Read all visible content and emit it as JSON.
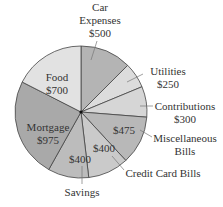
{
  "chart_data": {
    "type": "pie",
    "title": "",
    "unit": "$",
    "total": 4000,
    "start": "12 o'clock",
    "direction": "clockwise",
    "slices": [
      {
        "name": "Car Expenses",
        "value": 500,
        "label_lines": [
          "Car",
          "Expenses",
          "$500"
        ],
        "color": "#b4b4b4",
        "label_inside": false
      },
      {
        "name": "Utilities",
        "value": 250,
        "label_lines": [
          "Utilities",
          "$250"
        ],
        "color": "#dcdcdc",
        "label_inside": false
      },
      {
        "name": "Contributions",
        "value": 300,
        "label_lines": [
          "Contributions",
          "$300"
        ],
        "color": "#d6d6d6",
        "label_inside": false
      },
      {
        "name": "Miscellaneous Bills",
        "value": 475,
        "label_lines": [
          "Miscellaneous",
          "Bills"
        ],
        "value_label": "$475",
        "color": "#b8b8b8",
        "label_inside": "value"
      },
      {
        "name": "Credit Card Bills",
        "value": 400,
        "label_lines": [
          "Credit Card Bills"
        ],
        "value_label": "$400",
        "color": "#cacaca",
        "label_inside": "value"
      },
      {
        "name": "Savings",
        "value": 400,
        "label_lines": [
          "Savings"
        ],
        "value_label": "$400",
        "color": "#bcbcbc",
        "label_inside": "value"
      },
      {
        "name": "Mortgage",
        "value": 975,
        "label_lines": [
          "Mortgage",
          "$975"
        ],
        "color": "#a9a9a9",
        "label_inside": true
      },
      {
        "name": "Food",
        "value": 700,
        "label_lines": [
          "Food",
          "$700"
        ],
        "color": "#e2e2e2",
        "label_inside": true
      }
    ]
  }
}
